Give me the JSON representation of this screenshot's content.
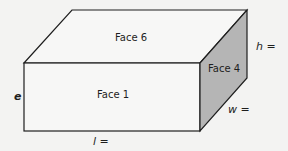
{
  "diagram": {
    "type": "cuboid",
    "faces": {
      "top": "Face 6",
      "front": "Face 1",
      "side": "Face 4"
    },
    "dimension_labels": {
      "height": "h =",
      "width": "w =",
      "length": "l =",
      "edge": "e"
    },
    "colors": {
      "background": "#f3f3f2",
      "stroke": "#1e1e1e",
      "face_fill": "#f7f7f6",
      "side_shade": "#b5b5b5"
    }
  }
}
